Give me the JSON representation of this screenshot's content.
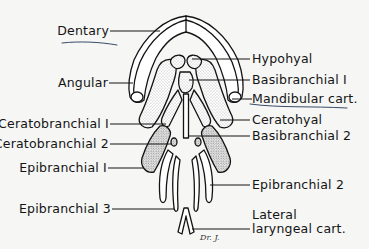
{
  "diagram": {
    "type": "anatomical line drawing",
    "background": "#f6f6f4",
    "ink": "#141414",
    "annotation_ink": "#3a4a6a",
    "labels_left": [
      {
        "id": "dentary",
        "text": "Dentary",
        "underlined": true
      },
      {
        "id": "angular",
        "text": "Angular"
      },
      {
        "id": "ceratobranchial1",
        "text": "Ceratobranchial I"
      },
      {
        "id": "ceratobranchial2",
        "text": "Ceratobranchial 2"
      },
      {
        "id": "epibranchial1",
        "text": "Epibranchial I"
      },
      {
        "id": "epibranchial3",
        "text": "Epibranchial 3"
      }
    ],
    "labels_right": [
      {
        "id": "hypohyal",
        "text": "Hypohyal"
      },
      {
        "id": "basibranchial1",
        "text": "Basibranchial I"
      },
      {
        "id": "mandibular",
        "text": "Mandibular cart.",
        "underlined": true
      },
      {
        "id": "ceratohyal",
        "text": "Ceratohyal"
      },
      {
        "id": "basibranchial2",
        "text": "Basibranchial 2"
      },
      {
        "id": "epibranchial2",
        "text": "Epibranchial 2"
      },
      {
        "id": "lateral1",
        "text": "Lateral"
      },
      {
        "id": "lateral2",
        "text": "laryngeal cart."
      }
    ],
    "signature": "Dr. J."
  }
}
